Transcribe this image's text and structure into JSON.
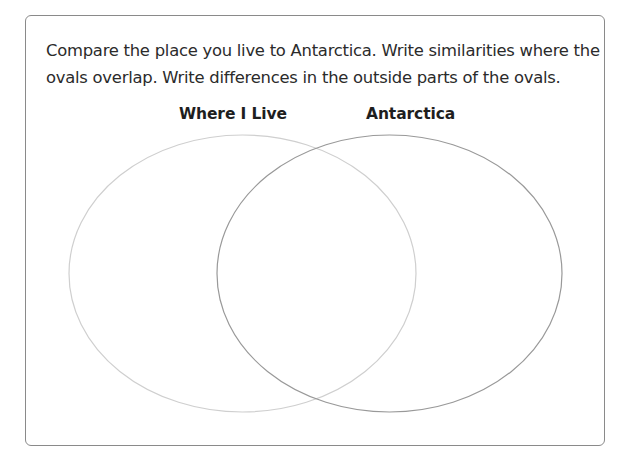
{
  "instructions": {
    "line1": "Compare the place you live to Antarctica. Write similarities where the",
    "line2": "ovals overlap. Write differences in the outside parts of the ovals."
  },
  "venn": {
    "left_label": "Where I Live",
    "right_label": "Antarctica",
    "colors": {
      "left_oval": "#cfcfcf",
      "right_oval": "#999999",
      "frame_border": "#8a8a8a",
      "text": "#2b2b2b"
    }
  }
}
